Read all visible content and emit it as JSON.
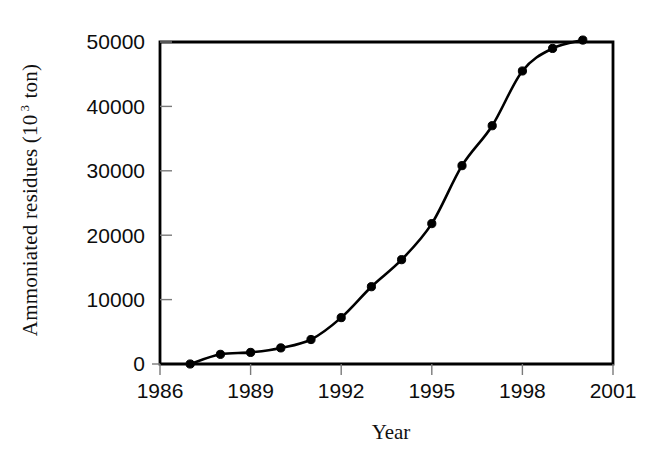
{
  "chart_data": {
    "type": "line",
    "title": "",
    "xlabel": "Year",
    "ylabel": "Ammoniated residues  (10 3 ton)",
    "ylabel_main": "Ammoniated residues  (10",
    "ylabel_sup": "3",
    "ylabel_tail": " ton)",
    "x": [
      1987,
      1988,
      1989,
      1990,
      1991,
      1992,
      1993,
      1994,
      1995,
      1996,
      1997,
      1998,
      1999,
      2000
    ],
    "values": [
      0,
      1500,
      1800,
      2500,
      3800,
      7200,
      12000,
      16200,
      21800,
      30800,
      37000,
      45500,
      49000,
      50300
    ],
    "series": [
      {
        "name": "Ammoniated residues",
        "values": [
          0,
          1500,
          1800,
          2500,
          3800,
          7200,
          12000,
          16200,
          21800,
          30800,
          37000,
          45500,
          49000,
          50300
        ]
      }
    ],
    "xlim": [
      1986,
      2001
    ],
    "ylim": [
      0,
      50000
    ],
    "xticks": [
      1986,
      1989,
      1992,
      1995,
      1998,
      2001
    ],
    "xtick_labels": [
      "1986",
      "1989",
      "1992",
      "1995",
      "1998",
      "2001"
    ],
    "yticks": [
      0,
      10000,
      20000,
      30000,
      40000,
      50000
    ],
    "ytick_labels": [
      "0",
      "10000",
      "20000",
      "30000",
      "40000",
      "50000"
    ],
    "grid": false,
    "legend": false,
    "legend_position": "none",
    "marker": "filled-circle",
    "line_color": "#000000",
    "marker_color": "#000000",
    "background_color": "#ffffff",
    "axis_color": "#000000"
  },
  "axes": {
    "x_tick_labels": [
      "1986",
      "1989",
      "1992",
      "1995",
      "1998",
      "2001"
    ],
    "y_tick_labels": [
      "0",
      "10000",
      "20000",
      "30000",
      "40000",
      "50000"
    ],
    "x_axis_title": "Year",
    "y_axis_title_main": "Ammoniated residues  (10",
    "y_axis_title_sup": "3",
    "y_axis_title_tail": " ton)"
  }
}
